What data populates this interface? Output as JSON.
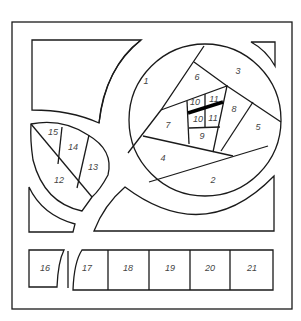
{
  "colors": {
    "stroke": "#1a1a1a",
    "background": "#ffffff",
    "label": "#444444"
  },
  "circle_pieces": [
    {
      "id": "1",
      "label": "1",
      "x": 146,
      "y": 82
    },
    {
      "id": "2",
      "label": "2",
      "x": 213,
      "y": 181
    },
    {
      "id": "3",
      "label": "3",
      "x": 238,
      "y": 72
    },
    {
      "id": "4",
      "label": "4",
      "x": 163,
      "y": 159
    },
    {
      "id": "5",
      "label": "5",
      "x": 258,
      "y": 128
    },
    {
      "id": "6",
      "label": "6",
      "x": 197,
      "y": 78
    },
    {
      "id": "7",
      "label": "7",
      "x": 168,
      "y": 126
    },
    {
      "id": "8",
      "label": "8",
      "x": 234,
      "y": 110
    },
    {
      "id": "9",
      "label": "9",
      "x": 202,
      "y": 137
    },
    {
      "id": "10a",
      "label": "10",
      "x": 195,
      "y": 103
    },
    {
      "id": "11a",
      "label": "11",
      "x": 214,
      "y": 100
    },
    {
      "id": "10b",
      "label": "10",
      "x": 198,
      "y": 120
    },
    {
      "id": "11b",
      "label": "11",
      "x": 213,
      "y": 119
    }
  ],
  "leaf_pieces": [
    {
      "id": "12",
      "label": "12",
      "x": 59,
      "y": 181
    },
    {
      "id": "13",
      "label": "13",
      "x": 93,
      "y": 168
    },
    {
      "id": "14",
      "label": "14",
      "x": 73,
      "y": 148
    },
    {
      "id": "15",
      "label": "15",
      "x": 53,
      "y": 133
    }
  ],
  "strip_pieces": [
    {
      "id": "16",
      "label": "16",
      "x": 45,
      "y": 269
    },
    {
      "id": "17",
      "label": "17",
      "x": 87,
      "y": 269
    },
    {
      "id": "18",
      "label": "18",
      "x": 128,
      "y": 269
    },
    {
      "id": "19",
      "label": "19",
      "x": 170,
      "y": 269
    },
    {
      "id": "20",
      "label": "20",
      "x": 210,
      "y": 269
    },
    {
      "id": "21",
      "label": "21",
      "x": 252,
      "y": 269
    }
  ]
}
